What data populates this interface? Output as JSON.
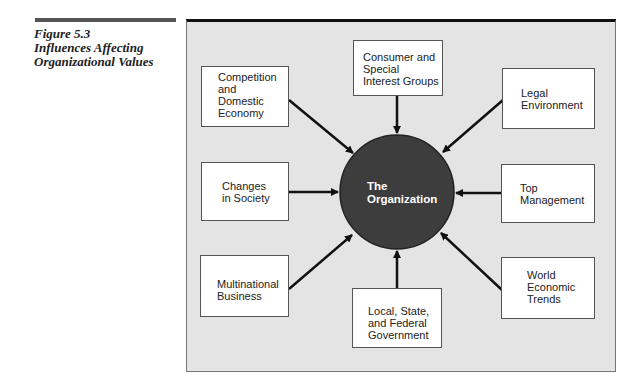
{
  "figure": {
    "number": "Figure 5.3",
    "title_line1": "Influences Affecting",
    "title_line2": "Organizational Values"
  },
  "center": {
    "label": "The\nOrganization",
    "color": "#3d3d3d"
  },
  "influences": [
    {
      "id": "competition",
      "label": "Competition\nand\nDomestic\nEconomy"
    },
    {
      "id": "consumer",
      "label": "Consumer and\nSpecial\nInterest Groups"
    },
    {
      "id": "legal",
      "label": "Legal\nEnvironment"
    },
    {
      "id": "society",
      "label": "Changes\nin Society"
    },
    {
      "id": "top-management",
      "label": "Top\nManagement"
    },
    {
      "id": "multinational",
      "label": "Multinational\nBusiness"
    },
    {
      "id": "government",
      "label": "Local, State,\nand Federal\nGovernment"
    },
    {
      "id": "world",
      "label": "World\nEconomic\nTrends"
    }
  ],
  "colors": {
    "panel": "#e4e4e4",
    "circle": "#3d3d3d",
    "arrow": "#111111"
  }
}
